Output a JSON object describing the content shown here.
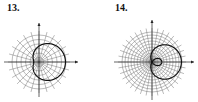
{
  "chart_data": [
    {
      "type": "polar-line",
      "label": "13.",
      "title": "",
      "grid": {
        "rings": 6,
        "spokes": 24,
        "on": true
      },
      "curve": "limacon r = a + b cos(theta), dimpled (a > b)",
      "params": {
        "a": 1.5,
        "b": 1,
        "orientation": "right"
      },
      "axes": {
        "x_arrow": true,
        "y_arrow": true
      }
    },
    {
      "type": "polar-line",
      "label": "14.",
      "title": "",
      "grid": {
        "rings": 10,
        "spokes": 36,
        "on": true
      },
      "curve": "limacon r = a + b cos(theta) with inner loop (a < b)",
      "params": {
        "a": 0.5,
        "b": 1,
        "orientation": "right"
      },
      "axes": {
        "x_arrow": true,
        "y_arrow": true
      }
    }
  ],
  "labels": {
    "p13": "13.",
    "p14": "14."
  }
}
